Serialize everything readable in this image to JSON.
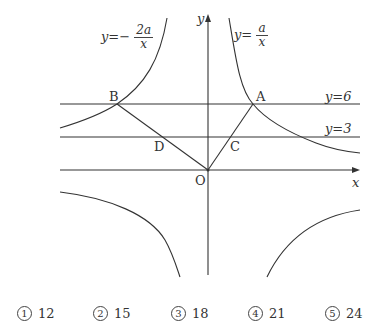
{
  "diagram": {
    "curve_left": {
      "prefix": "y=−",
      "numerator": "2a",
      "denominator": "x"
    },
    "curve_right": {
      "prefix": "y=",
      "numerator": "a",
      "denominator": "x"
    },
    "axis_x_label": "x",
    "axis_y_label": "y",
    "line_top_label": "y=6",
    "line_mid_label": "y=3",
    "points": {
      "A": "A",
      "B": "B",
      "C": "C",
      "D": "D",
      "O": "O"
    }
  },
  "choices": [
    {
      "marker": "1",
      "value": "12"
    },
    {
      "marker": "2",
      "value": "15"
    },
    {
      "marker": "3",
      "value": "18"
    },
    {
      "marker": "4",
      "value": "21"
    },
    {
      "marker": "5",
      "value": "24"
    }
  ]
}
